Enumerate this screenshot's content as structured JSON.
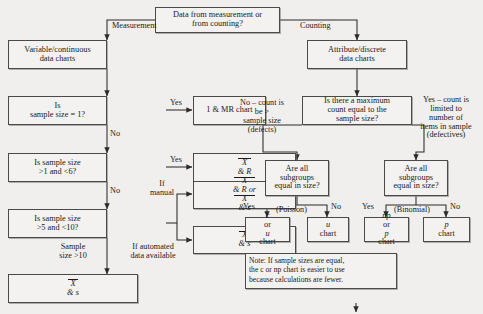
{
  "nodes": {
    "root": {
      "line1": "Data from measurement or",
      "line2": "from counting?"
    },
    "variable_charts": {
      "line1": "Variable/continuous",
      "line2": "data charts"
    },
    "attribute_charts": {
      "line1": "Attribute/discrete",
      "line2": "data charts"
    },
    "d_size1": {
      "line1": "Is",
      "line2": "sample size = 1?"
    },
    "d_size1to6": {
      "line1": "Is sample size",
      "line2": ">1 and <6?"
    },
    "d_size5to10": {
      "line1": "Is sample size",
      "line2": ">5 and <10?"
    },
    "imr_chart": {
      "text": "1 & MR chart"
    },
    "xbar_r": {
      "x": "X",
      "rest": " & R"
    },
    "xbar_r_or_s": {
      "l1_x": "X",
      "l1_rest": " & R or",
      "l2_x": "X",
      "l2_rest": " & s"
    },
    "xbar_s_auto": {
      "x": "X",
      "rest": " & s"
    },
    "xbar_s_final": {
      "x": "X",
      "rest": " & s"
    },
    "d_maxcount": {
      "line1": "Is there a maximum",
      "line2": "count equal to the",
      "line3": "sample size?"
    },
    "d_subgroups_left": {
      "line1": "Are all",
      "line2": "subgroups",
      "line3": "equal in size?"
    },
    "d_subgroups_right": {
      "line1": "Are all",
      "line2": "subgroups",
      "line3": "equal in size?"
    },
    "c_or_u_chart": {
      "line1_it": "c",
      "line1_rest": " or ",
      "line1_it2": "u",
      "line2": "chart"
    },
    "u_chart": {
      "line1_it": "u",
      "line2": "chart"
    },
    "np_or_p_chart": {
      "line1_it": "np",
      "line1_rest": " or ",
      "line1_it2": "p",
      "line2": "chart"
    },
    "p_chart": {
      "it": "p",
      "rest": " chart"
    },
    "note": {
      "line1": "Note: If sample sizes are equal,",
      "line2": "the c or np chart is easier to use",
      "line3": "because calculations are fewer."
    }
  },
  "edge_labels": {
    "measurement": "Measurement",
    "counting": "Counting",
    "yes_size1": "Yes",
    "no_size1": "No",
    "yes_size1to6": "Yes",
    "no_size1to6": "No",
    "if_manual_l1": "If",
    "if_manual_l2": "manual",
    "if_automated_l1": "If automated",
    "if_automated_l2": "data available",
    "sample_size_gt10_l1": "Sample",
    "sample_size_gt10_l2": "size >10",
    "no_count_l1": "No – count is",
    "no_count_l2": "be >",
    "no_count_l3": "sample size",
    "no_count_l4": "(defects)",
    "yes_count_l1": "Yes – count is",
    "yes_count_l2": "limited to",
    "yes_count_l3": "number of",
    "yes_count_l4": "items in sample",
    "yes_count_l5": "(defectives)",
    "yes_poisson": "Yes",
    "poisson": "(Poisson)",
    "no_poisson": "No",
    "yes_binomial": "Yes",
    "binomial": "(Binomial)",
    "no_binomial": "No"
  },
  "colors": {
    "background": "#f0efed",
    "box_fill": "#f3f2f0",
    "border": "#4a4a4a",
    "text": "#1a1a1a"
  }
}
